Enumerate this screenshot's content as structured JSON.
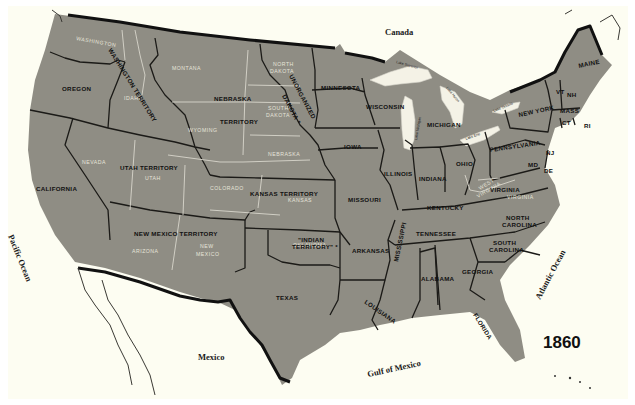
{
  "map": {
    "year": "1860",
    "colors": {
      "background": "#fdfdf2",
      "land": "#8f8d84",
      "border": "#1b1a17",
      "modern_border": "#d8d6cc"
    },
    "countries": {
      "north": "Canada",
      "south": "Mexico"
    },
    "water_bodies": {
      "pacific": "Pacific Ocean",
      "atlantic": "Atlantic Ocean",
      "gulf": "Gulf of Mexico"
    },
    "lakes": {
      "superior": "Lake Superior",
      "michigan": "Lake Michigan",
      "huron": "Lake Huron",
      "erie": "Lake Erie",
      "ontario": "Lake Ontario"
    },
    "states_territories": {
      "oregon": "OREGON",
      "washington_territory": "WASHINGTON TERRITORY",
      "nebraska_territory_1": "NEBRASKA",
      "nebraska_territory_2": "TERRITORY",
      "unorganized_dakota_1": "UNORGANIZED",
      "unorganized_dakota_2": "DAKOTA *",
      "minnesota": "MINNESOTA",
      "wisconsin": "WISCONSIN",
      "michigan": "MICHIGAN",
      "new_york": "NEW YORK",
      "maine": "MAINE",
      "vt": "VT",
      "nh": "NH",
      "mass": "MASS",
      "ct": "CT",
      "ri": "RI",
      "nj": "NJ",
      "de": "DE",
      "md": "MD",
      "pennsylvania": "PENNSYLVANIA",
      "ohio": "OHIO",
      "indiana": "INDIANA",
      "illinois": "ILLINOIS",
      "iowa": "IOWA",
      "california": "CALIFORNIA",
      "utah_territory": "UTAH TERRITORY",
      "kansas_territory": "KANSAS TERRITORY",
      "missouri": "MISSOURI",
      "kentucky": "KENTUCKY",
      "virginia": "VIRGINIA",
      "north_carolina_1": "NORTH",
      "north_carolina_2": "CAROLINA",
      "tennessee": "TENNESSEE",
      "south_carolina_1": "SOUTH",
      "south_carolina_2": "CAROLINA",
      "new_mexico_territory": "NEW MEXICO TERRITORY",
      "indian_territory_1": "\"INDIAN",
      "indian_territory_2": "TERRITORY\" *",
      "arkansas": "ARKANSAS",
      "mississippi": "MISSISSIPPI",
      "alabama": "ALABAMA",
      "georgia": "GEORGIA",
      "texas": "TEXAS",
      "louisiana": "LOUISIANA",
      "florida": "FLORIDA"
    },
    "modern_state_labels": {
      "washington": "WASHINGTON",
      "idaho": "IDAHO",
      "montana": "MONTANA",
      "wyoming": "WYOMING",
      "north_dakota_1": "NORTH",
      "north_dakota_2": "DAKOTA",
      "south_dakota_1": "SOUTH",
      "south_dakota_2": "DAKOTA",
      "nebraska": "NEBRASKA",
      "nevada": "NEVADA",
      "utah": "UTAH",
      "colorado": "COLORADO",
      "kansas": "KANSAS",
      "arizona": "ARIZONA",
      "new_mexico_1": "NEW",
      "new_mexico_2": "MEXICO",
      "oklahoma": "OKLAHOMA",
      "west_virginia_1": "WEST",
      "west_virginia_2": "VIRGINIA",
      "virginia": "VIRGINIA"
    }
  }
}
